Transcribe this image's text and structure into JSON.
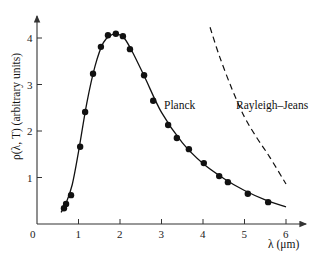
{
  "chart_data": {
    "type": "line",
    "title": "",
    "xlabel": "λ (μm)",
    "ylabel": "ρ(λ, T) (arbitrary units)",
    "xlim": [
      0,
      6.5
    ],
    "ylim": [
      0,
      4.4
    ],
    "x_ticks": [
      "0",
      "1",
      "2",
      "3",
      "4",
      "5",
      "6"
    ],
    "y_ticks": [
      "1",
      "2",
      "3",
      "4"
    ],
    "grid": false,
    "legend": "none (inline annotations)",
    "annotations": [
      {
        "text": "Planck",
        "x": 3.0,
        "y": 2.55
      },
      {
        "text": "Rayleigh–Jeans",
        "x": 4.8,
        "y": 2.55
      }
    ],
    "series": [
      {
        "name": "Measured data",
        "style": "scatter",
        "x": [
          0.65,
          0.7,
          0.82,
          1.04,
          1.16,
          1.35,
          1.54,
          1.71,
          1.9,
          2.07,
          2.24,
          2.58,
          2.8,
          3.16,
          3.37,
          3.66,
          4.02,
          4.39,
          4.6,
          5.08,
          5.57
        ],
        "y": [
          0.34,
          0.43,
          0.62,
          1.66,
          2.41,
          3.23,
          3.81,
          4.06,
          4.09,
          4.04,
          3.76,
          3.2,
          2.65,
          2.13,
          1.85,
          1.61,
          1.31,
          1.03,
          0.9,
          0.65,
          0.47
        ]
      },
      {
        "name": "Planck",
        "style": "solid",
        "x": [
          0.58,
          0.7,
          0.85,
          1.0,
          1.2,
          1.4,
          1.6,
          1.8,
          1.95,
          2.1,
          2.3,
          2.6,
          3.0,
          3.5,
          4.0,
          4.5,
          5.0,
          5.5,
          6.0
        ],
        "y": [
          0.25,
          0.45,
          0.85,
          1.55,
          2.6,
          3.4,
          3.9,
          4.07,
          4.08,
          4.0,
          3.7,
          3.15,
          2.4,
          1.75,
          1.3,
          0.98,
          0.72,
          0.52,
          0.37
        ]
      },
      {
        "name": "Rayleigh–Jeans",
        "style": "dashed",
        "x": [
          4.17,
          4.4,
          4.7,
          5.0,
          5.3,
          5.6,
          6.0
        ],
        "y": [
          4.23,
          3.6,
          2.9,
          2.3,
          1.85,
          1.45,
          0.86
        ]
      }
    ]
  }
}
